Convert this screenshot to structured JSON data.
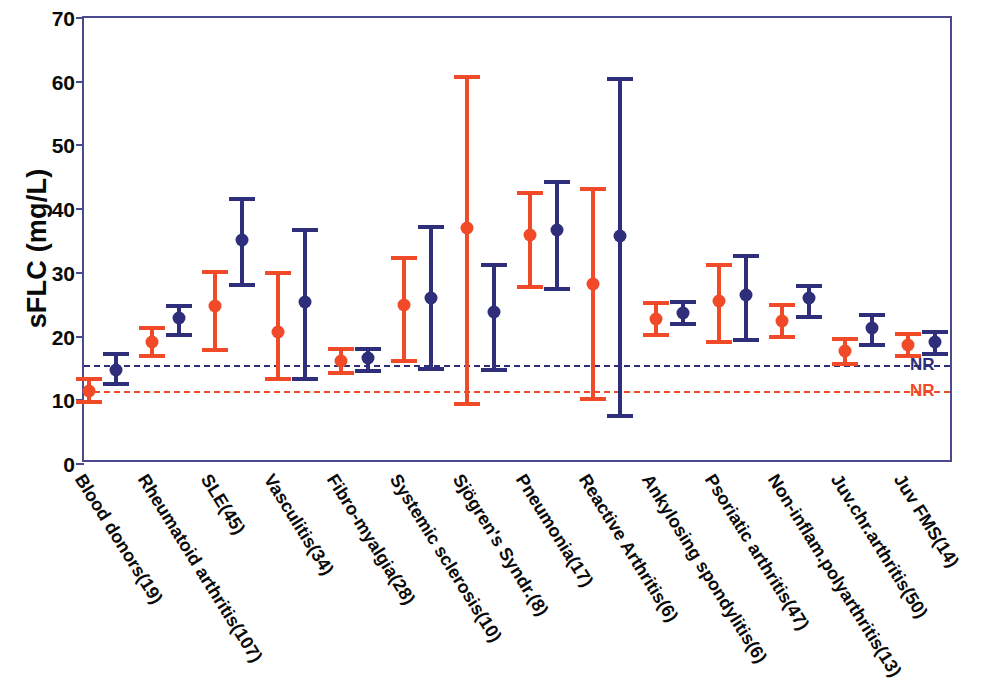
{
  "chart_data": {
    "type": "scatter",
    "title": "",
    "xlabel": "",
    "ylabel": "sFLC (mg/L)",
    "ylim": [
      0,
      70
    ],
    "yticks": [
      0,
      10,
      20,
      30,
      40,
      50,
      60,
      70
    ],
    "grid": false,
    "legend_position": "none",
    "categories": [
      "Blood donors(19)",
      "Rheumatoid arthritis(107)",
      "SLE(45)",
      "Vasculitis(34)",
      "Fibro-myalgia(28)",
      "Systemic sclerosis(10)",
      "Sjögren's Syndr.(8)",
      "Pneumonia(17)",
      "Reactive Arthritis(6)",
      "Ankylosing spondylitis(6)",
      "Psoriatic arthritis(47)",
      "Non-inflam.polyarthritis(13)",
      "Juv.chr.arthritis(50)",
      "Juv FMS(14)"
    ],
    "series": [
      {
        "name": "orange-series",
        "color": "#f04a28",
        "values": [
          11.5,
          19.2,
          24.8,
          20.7,
          16.2,
          25.0,
          37.0,
          36.0,
          28.3,
          22.8,
          25.6,
          22.4,
          17.8,
          18.6
        ],
        "lower": [
          9.8,
          16.9,
          17.9,
          13.3,
          14.3,
          16.2,
          9.4,
          27.7,
          10.2,
          20.3,
          19.2,
          19.9,
          15.7,
          16.9
        ],
        "upper": [
          13.3,
          21.4,
          30.1,
          29.9,
          18.0,
          32.3,
          60.8,
          42.6,
          43.2,
          25.2,
          31.3,
          25.0,
          19.6,
          20.4
        ]
      },
      {
        "name": "navy-series",
        "color": "#2e2e7a",
        "values": [
          14.8,
          22.9,
          35.1,
          25.5,
          16.7,
          26.1,
          23.8,
          36.7,
          35.8,
          23.7,
          26.5,
          26.1,
          21.4,
          19.1
        ],
        "lower": [
          12.5,
          20.3,
          28.1,
          13.4,
          14.6,
          14.9,
          14.7,
          27.4,
          7.5,
          21.9,
          19.4,
          23.0,
          18.7,
          17.3
        ],
        "upper": [
          17.2,
          24.8,
          41.6,
          36.8,
          18.1,
          37.2,
          31.3,
          44.2,
          60.4,
          25.4,
          32.6,
          28.0,
          23.4,
          20.7
        ]
      }
    ],
    "reference_lines": [
      {
        "label": "NR",
        "value": 15.5,
        "color": "#2e2e7a",
        "style": "dashed",
        "series": "navy-series"
      },
      {
        "label": "NR",
        "value": 11.4,
        "color": "#f04a28",
        "style": "dashed",
        "series": "orange-series"
      }
    ]
  },
  "axis": {
    "y_title": "sFLC (mg/L)",
    "y_tick_labels": [
      "0",
      "10",
      "20",
      "30",
      "40",
      "50",
      "60",
      "70"
    ]
  },
  "colors": {
    "orange": "#f04a28",
    "navy": "#2e2e7a",
    "frame": "#4a4a8c",
    "text": "#0a0a0a",
    "background": "#ffffff"
  }
}
